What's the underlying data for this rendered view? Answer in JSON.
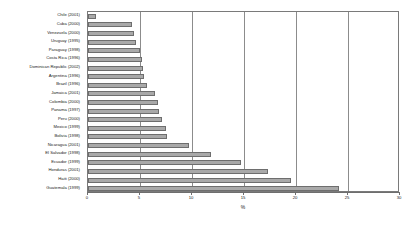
{
  "chart_data": {
    "type": "bar",
    "orientation": "horizontal",
    "title": "",
    "subtitle": "",
    "xlabel": "%",
    "ylabel": "",
    "xlim": [
      0,
      30
    ],
    "xticks": [
      0,
      5,
      10,
      15,
      20,
      25,
      30
    ],
    "xticklabels": [
      "0",
      "5",
      "10",
      "15",
      "20",
      "25",
      "30"
    ],
    "grid": "vertical",
    "legend": "none",
    "categories": [
      "Chile (2001)",
      "Cuba (2000)",
      "Venezuela (2000)",
      "Uruguay (1995)",
      "Paraguay (1998)",
      "Costa Rica (1996)",
      "Dominican Republic (2002)",
      "Argentina (1996)",
      "Brazil (1996)",
      "Jamaica (2001)",
      "Colombia (2000)",
      "Panama (1997)",
      "Peru (2000)",
      "Mexico (1999)",
      "Bolivia (1998)",
      "Nicaragua (2001)",
      "El Salvador (1998)",
      "Ecuador (1999)",
      "Honduras (2001)",
      "Haiti (2000)",
      "Guatemala (1999)"
    ],
    "values": [
      0.8,
      4.2,
      4.4,
      4.6,
      5.0,
      5.2,
      5.3,
      5.4,
      5.7,
      6.4,
      6.7,
      6.8,
      7.1,
      7.5,
      7.6,
      9.7,
      11.8,
      14.7,
      17.3,
      19.5,
      24.1
    ],
    "series": [
      {
        "name": "percent",
        "values": [
          0.8,
          4.2,
          4.4,
          4.6,
          5.0,
          5.2,
          5.3,
          5.4,
          5.7,
          6.4,
          6.7,
          6.8,
          7.1,
          7.5,
          7.6,
          9.7,
          11.8,
          14.7,
          17.3,
          19.5,
          24.1
        ]
      }
    ],
    "colors": {
      "bar_fill": "#a9a9a9",
      "bar_edge": "#6e6e6e",
      "gridline": "#8c8c8c",
      "axis": "#6e6e6e",
      "text": "#222222",
      "background": "#ffffff"
    }
  }
}
